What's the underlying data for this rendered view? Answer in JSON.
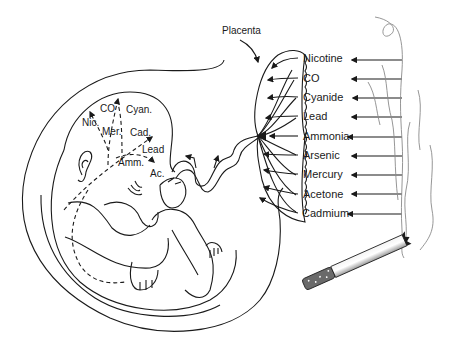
{
  "diagram": {
    "title_label": "Placenta",
    "toxins": [
      {
        "name": "Nicotine",
        "y": 58
      },
      {
        "name": "CO",
        "y": 78
      },
      {
        "name": "Cyanide",
        "y": 97
      },
      {
        "name": "Lead",
        "y": 116
      },
      {
        "name": "Ammonia",
        "y": 136
      },
      {
        "name": "Arsenic",
        "y": 155
      },
      {
        "name": "Mercury",
        "y": 174
      },
      {
        "name": "Acetone",
        "y": 194
      },
      {
        "name": "Cadmium",
        "y": 213
      }
    ],
    "fetal_labels": {
      "nic": "Nic.",
      "co": "CO",
      "cyan": "Cyan.",
      "mer": "Mer.",
      "cad": "Cad.",
      "lead": "Lead",
      "amm": "Amm.",
      "ac": "Ac."
    },
    "colors": {
      "line": "#1a1a1a",
      "smoke": "#8a8a8a",
      "filter": "#6a6a6a",
      "cigarette_body": "#e0e0e0"
    }
  }
}
